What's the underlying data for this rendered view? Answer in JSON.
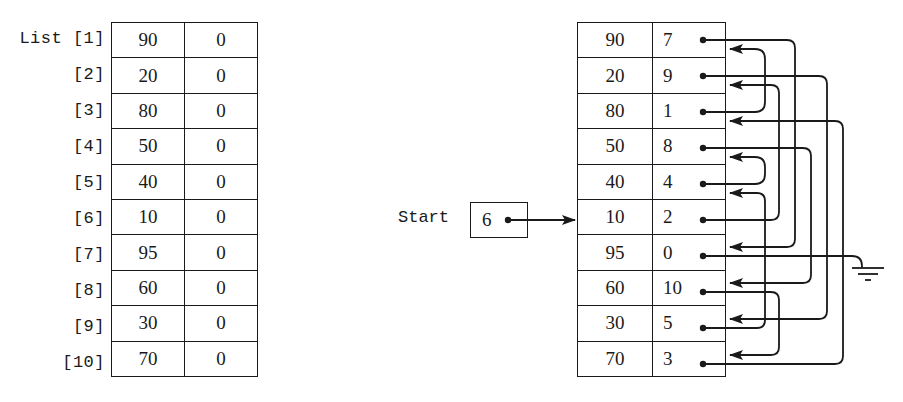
{
  "left_array": {
    "name_label": "List",
    "indices": [
      "[1]",
      "[2]",
      "[3]",
      "[4]",
      "[5]",
      "[6]",
      "[7]",
      "[8]",
      "[9]",
      "[10]"
    ],
    "rows": [
      {
        "value": "90",
        "link": "0"
      },
      {
        "value": "20",
        "link": "0"
      },
      {
        "value": "80",
        "link": "0"
      },
      {
        "value": "50",
        "link": "0"
      },
      {
        "value": "40",
        "link": "0"
      },
      {
        "value": "10",
        "link": "0"
      },
      {
        "value": "95",
        "link": "0"
      },
      {
        "value": "60",
        "link": "0"
      },
      {
        "value": "30",
        "link": "0"
      },
      {
        "value": "70",
        "link": "0"
      }
    ]
  },
  "start_pointer": {
    "label": "Start",
    "value": "6"
  },
  "linked_array": {
    "rows": [
      {
        "value": "90",
        "link": "7"
      },
      {
        "value": "20",
        "link": "9"
      },
      {
        "value": "80",
        "link": "1"
      },
      {
        "value": "50",
        "link": "8"
      },
      {
        "value": "40",
        "link": "4"
      },
      {
        "value": "10",
        "link": "2"
      },
      {
        "value": "95",
        "link": "0"
      },
      {
        "value": "60",
        "link": "10"
      },
      {
        "value": "30",
        "link": "5"
      },
      {
        "value": "70",
        "link": "3"
      }
    ],
    "null_symbol": "ground"
  },
  "colors": {
    "ink": "#1a1a1a",
    "background": "#ffffff"
  }
}
